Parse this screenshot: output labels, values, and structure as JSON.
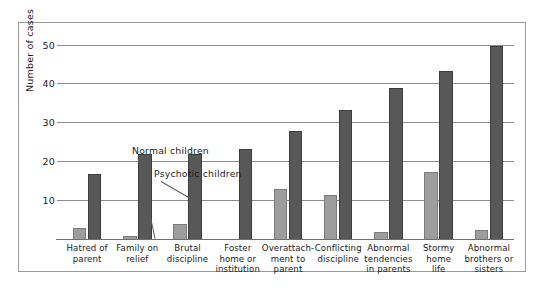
{
  "chart_data": {
    "type": "bar",
    "title": "",
    "xlabel": "",
    "ylabel": "Number of cases",
    "ylim": [
      0,
      54
    ],
    "yticks": [
      10,
      20,
      30,
      40,
      50
    ],
    "grid": true,
    "legend_position": "inline-annotation",
    "categories": [
      "Hatred of parent",
      "Family on relief",
      "Brutal discipline",
      "Foster home or institution",
      "Overattach-ment to parent",
      "Conflicting discipline",
      "Abnormal tendencies in parents",
      "Stormy home life",
      "Abnormal brothers or sisters"
    ],
    "category_lines": [
      [
        "Hatred of",
        "parent"
      ],
      [
        "Family on",
        "relief"
      ],
      [
        "Brutal",
        "discipline"
      ],
      [
        "Foster",
        "home or",
        "institution"
      ],
      [
        "Overattach-",
        "ment to",
        "parent"
      ],
      [
        "Conflicting",
        "discipline"
      ],
      [
        "Abnormal",
        "tendencies",
        "in parents"
      ],
      [
        "Stormy",
        "home",
        "life"
      ],
      [
        "Abnormal",
        "brothers or",
        "sisters"
      ]
    ],
    "series": [
      {
        "name": "Normal children",
        "color": "#9d9d9d",
        "values": [
          3,
          1,
          4,
          0,
          13,
          11.5,
          2,
          17.5,
          2.5
        ]
      },
      {
        "name": "Psychotic children",
        "color": "#585858",
        "values": [
          17,
          22,
          22,
          23.5,
          28,
          33.5,
          39,
          43.5,
          50
        ]
      }
    ]
  },
  "annotations": {
    "normal_label": "Normal children",
    "psychotic_label": "Psychotic children"
  },
  "axis": {
    "y_title": "Number of cases",
    "tick_labels": [
      "50",
      "40",
      "30",
      "20",
      "10"
    ]
  }
}
